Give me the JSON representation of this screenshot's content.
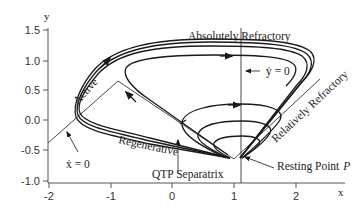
{
  "figure": {
    "x_axis": {
      "label": "x",
      "ticks": [
        "-2",
        "-1",
        "0",
        "1",
        "2"
      ]
    },
    "y_axis": {
      "label": "y",
      "ticks": [
        "1.5",
        "1.0",
        "0.5",
        "0.0",
        "-0.5",
        "-1.0"
      ]
    },
    "annotations": {
      "absolutely_refractory": "Absolutely Refractory",
      "y_nullcline": "ẏ = 0",
      "x_nullcline": "ẋ = 0",
      "active": "Active",
      "regenerative": "Regenerative",
      "relatively_refractory": "Relatively Refractory",
      "qtp_separatrix": "QTP Separatrix",
      "resting_point": "Resting Point",
      "resting_point_symbol": "P"
    },
    "colors": {
      "line": "#1a1a1a",
      "axis": "#555555",
      "background": "#ffffff"
    }
  }
}
